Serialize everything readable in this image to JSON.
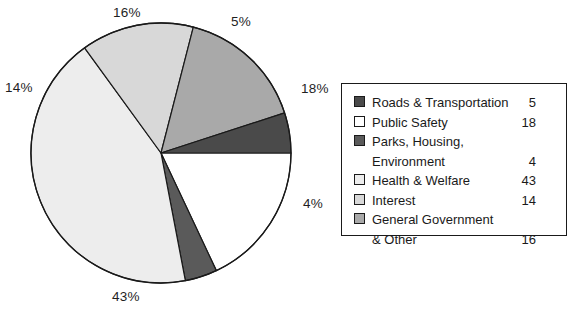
{
  "chart_data": {
    "type": "pie",
    "title": "",
    "subtitle": "",
    "xlabel": "",
    "ylabel": "",
    "grid": false,
    "legend_position": "right",
    "units": "percent",
    "total": 100,
    "start_angle_deg": 0,
    "direction": "clockwise",
    "categories": [
      "Roads & Transportation",
      "Public Safety",
      "Parks, Housing, Environment",
      "Health & Welfare",
      "Interest",
      "General Government & Other"
    ],
    "values": [
      5,
      18,
      4,
      43,
      14,
      16
    ],
    "slice_labels": [
      "5%",
      "18%",
      "4%",
      "43%",
      "14%",
      "16%"
    ],
    "colors": [
      "#4a4a4a",
      "#ffffff",
      "#5a5a5a",
      "#ededed",
      "#d8d8d8",
      "#a9a9a9"
    ]
  },
  "pie": {
    "center_x": 161,
    "center_y": 153,
    "radius": 130,
    "outline_color": "#1a1a1a",
    "slices": [
      {
        "name": "public-safety",
        "label": "18%",
        "value": 18,
        "fill": "#ffffff",
        "start": 0,
        "end": 64.8
      },
      {
        "name": "parks-housing",
        "label": "4%",
        "value": 4,
        "fill": "#5a5a5a",
        "start": 64.8,
        "end": 79.2
      },
      {
        "name": "health-welfare",
        "label": "43%",
        "value": 43,
        "fill": "#ededed",
        "start": 79.2,
        "end": 234.0
      },
      {
        "name": "interest",
        "label": "14%",
        "value": 14,
        "fill": "#d8d8d8",
        "start": 234.0,
        "end": 284.4
      },
      {
        "name": "general-government",
        "label": "16%",
        "value": 16,
        "fill": "#a9a9a9",
        "start": 284.4,
        "end": 342.0
      },
      {
        "name": "roads-transportation",
        "label": "5%",
        "value": 5,
        "fill": "#4a4a4a",
        "start": 342.0,
        "end": 360.0
      }
    ],
    "labels": {
      "sixteen": "16%",
      "five": "5%",
      "eighteen": "18%",
      "four": "4%",
      "fortythree": "43%",
      "fourteen": "14%"
    }
  },
  "legend": {
    "rows": [
      {
        "label": "Roads & Transportation",
        "value": "5",
        "swatch": "#4a4a4a",
        "swatch_visible": true
      },
      {
        "label": "Public Safety",
        "value": "18",
        "swatch": "#ffffff",
        "swatch_visible": true
      },
      {
        "label": "Parks, Housing,",
        "value": "",
        "swatch": "#5a5a5a",
        "swatch_visible": true
      },
      {
        "label": "Environment",
        "value": "4",
        "swatch": "",
        "swatch_visible": false
      },
      {
        "label": "Health & Welfare",
        "value": "43",
        "swatch": "#ededed",
        "swatch_visible": true
      },
      {
        "label": "Interest",
        "value": "14",
        "swatch": "#d8d8d8",
        "swatch_visible": true
      },
      {
        "label": "General Government",
        "value": "",
        "swatch": "#a9a9a9",
        "swatch_visible": true
      },
      {
        "label": "& Other",
        "value": "16",
        "swatch": "",
        "swatch_visible": false
      }
    ]
  }
}
